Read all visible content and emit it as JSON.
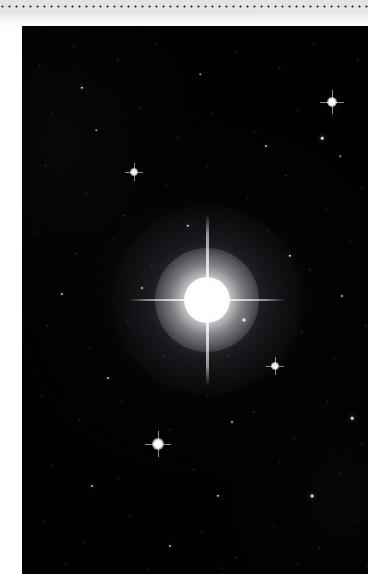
{
  "page": {
    "width": 368,
    "height": 574,
    "background_color": "#ffffff"
  },
  "top_band": {
    "name": "perforated-binding-edge",
    "height": 26,
    "gradient_from": "#e6e6e6",
    "gradient_to": "#fdfdfd",
    "perforation": {
      "dot_count": 53,
      "dot_spacing": 7,
      "dot_diameter": 2.7,
      "dot_color": "#3a3a3a",
      "row_y": 7
    }
  },
  "paper": {
    "margin_left_width": 22,
    "margin_color": "#ffffff"
  },
  "photo": {
    "name": "night-sky-photograph",
    "left": 22,
    "top": 26,
    "width": 346,
    "height": 548,
    "background_color": "#010102",
    "main_star": {
      "name": "bright-central-star",
      "x": 185,
      "y": 274,
      "core_diameter": 46,
      "halo_diameter": 190,
      "spike_vertical_length": 172,
      "spike_horizontal_length": 156,
      "color": "#ffffff"
    },
    "bright_stars": [
      {
        "x": 310,
        "y": 76,
        "size": 4.2,
        "opacity": 1.0,
        "flare": true
      },
      {
        "x": 136,
        "y": 418,
        "size": 4.6,
        "opacity": 1.0,
        "flare": true
      },
      {
        "x": 112,
        "y": 146,
        "size": 3.4,
        "opacity": 0.95,
        "flare": true
      },
      {
        "x": 253,
        "y": 340,
        "size": 3.2,
        "opacity": 0.95,
        "flare": true
      },
      {
        "x": 222,
        "y": 294,
        "size": 2.8,
        "opacity": 0.9,
        "flare": false
      },
      {
        "x": 300,
        "y": 112,
        "size": 2.6,
        "opacity": 0.85,
        "flare": false
      },
      {
        "x": 268,
        "y": 230,
        "size": 2.4,
        "opacity": 0.85,
        "flare": false
      },
      {
        "x": 60,
        "y": 62,
        "size": 2.4,
        "opacity": 0.8,
        "flare": false
      },
      {
        "x": 166,
        "y": 200,
        "size": 2.4,
        "opacity": 0.8,
        "flare": false
      },
      {
        "x": 40,
        "y": 268,
        "size": 2.2,
        "opacity": 0.8,
        "flare": false
      },
      {
        "x": 330,
        "y": 392,
        "size": 2.6,
        "opacity": 0.85,
        "flare": false
      },
      {
        "x": 196,
        "y": 470,
        "size": 2.4,
        "opacity": 0.8,
        "flare": false
      },
      {
        "x": 86,
        "y": 352,
        "size": 2.2,
        "opacity": 0.75,
        "flare": false
      },
      {
        "x": 290,
        "y": 470,
        "size": 2.8,
        "opacity": 0.85,
        "flare": false
      },
      {
        "x": 148,
        "y": 520,
        "size": 2.2,
        "opacity": 0.75,
        "flare": false
      },
      {
        "x": 244,
        "y": 120,
        "size": 2.2,
        "opacity": 0.75,
        "flare": false
      },
      {
        "x": 70,
        "y": 460,
        "size": 2.2,
        "opacity": 0.75,
        "flare": false
      },
      {
        "x": 320,
        "y": 270,
        "size": 2.0,
        "opacity": 0.7,
        "flare": false
      },
      {
        "x": 120,
        "y": 262,
        "size": 2.0,
        "opacity": 0.7,
        "flare": false
      },
      {
        "x": 210,
        "y": 396,
        "size": 2.0,
        "opacity": 0.7,
        "flare": false
      }
    ],
    "field_stars": [
      {
        "x": 18,
        "y": 40,
        "size": 1.3,
        "opacity": 0.52
      },
      {
        "x": 52,
        "y": 20,
        "size": 1.1,
        "opacity": 0.42
      },
      {
        "x": 96,
        "y": 34,
        "size": 1.4,
        "opacity": 0.55
      },
      {
        "x": 134,
        "y": 18,
        "size": 1.1,
        "opacity": 0.4
      },
      {
        "x": 178,
        "y": 48,
        "size": 1.5,
        "opacity": 0.6
      },
      {
        "x": 214,
        "y": 26,
        "size": 1.2,
        "opacity": 0.45
      },
      {
        "x": 258,
        "y": 42,
        "size": 1.3,
        "opacity": 0.5
      },
      {
        "x": 292,
        "y": 18,
        "size": 1.1,
        "opacity": 0.4
      },
      {
        "x": 336,
        "y": 34,
        "size": 1.4,
        "opacity": 0.55
      },
      {
        "x": 30,
        "y": 88,
        "size": 1.2,
        "opacity": 0.45
      },
      {
        "x": 74,
        "y": 104,
        "size": 1.5,
        "opacity": 0.6
      },
      {
        "x": 118,
        "y": 82,
        "size": 1.2,
        "opacity": 0.45
      },
      {
        "x": 156,
        "y": 112,
        "size": 1.4,
        "opacity": 0.55
      },
      {
        "x": 190,
        "y": 88,
        "size": 1.1,
        "opacity": 0.4
      },
      {
        "x": 232,
        "y": 106,
        "size": 1.3,
        "opacity": 0.5
      },
      {
        "x": 276,
        "y": 84,
        "size": 1.2,
        "opacity": 0.45
      },
      {
        "x": 318,
        "y": 130,
        "size": 1.5,
        "opacity": 0.6
      },
      {
        "x": 24,
        "y": 140,
        "size": 1.3,
        "opacity": 0.5
      },
      {
        "x": 64,
        "y": 168,
        "size": 1.2,
        "opacity": 0.45
      },
      {
        "x": 102,
        "y": 190,
        "size": 1.4,
        "opacity": 0.55
      },
      {
        "x": 144,
        "y": 160,
        "size": 1.1,
        "opacity": 0.4
      },
      {
        "x": 186,
        "y": 142,
        "size": 1.3,
        "opacity": 0.5
      },
      {
        "x": 226,
        "y": 172,
        "size": 1.2,
        "opacity": 0.45
      },
      {
        "x": 264,
        "y": 150,
        "size": 1.4,
        "opacity": 0.55
      },
      {
        "x": 304,
        "y": 184,
        "size": 1.2,
        "opacity": 0.45
      },
      {
        "x": 340,
        "y": 162,
        "size": 1.3,
        "opacity": 0.5
      },
      {
        "x": 16,
        "y": 206,
        "size": 1.2,
        "opacity": 0.45
      },
      {
        "x": 54,
        "y": 228,
        "size": 1.4,
        "opacity": 0.55
      },
      {
        "x": 92,
        "y": 212,
        "size": 1.1,
        "opacity": 0.4
      },
      {
        "x": 130,
        "y": 240,
        "size": 1.3,
        "opacity": 0.5
      },
      {
        "x": 246,
        "y": 204,
        "size": 1.2,
        "opacity": 0.45
      },
      {
        "x": 288,
        "y": 244,
        "size": 1.4,
        "opacity": 0.55
      },
      {
        "x": 328,
        "y": 216,
        "size": 1.2,
        "opacity": 0.45
      },
      {
        "x": 26,
        "y": 300,
        "size": 1.4,
        "opacity": 0.55
      },
      {
        "x": 68,
        "y": 322,
        "size": 1.2,
        "opacity": 0.45
      },
      {
        "x": 106,
        "y": 296,
        "size": 1.3,
        "opacity": 0.5
      },
      {
        "x": 142,
        "y": 330,
        "size": 1.1,
        "opacity": 0.4
      },
      {
        "x": 280,
        "y": 306,
        "size": 1.3,
        "opacity": 0.5
      },
      {
        "x": 312,
        "y": 332,
        "size": 1.2,
        "opacity": 0.45
      },
      {
        "x": 344,
        "y": 300,
        "size": 1.4,
        "opacity": 0.55
      },
      {
        "x": 20,
        "y": 370,
        "size": 1.2,
        "opacity": 0.45
      },
      {
        "x": 58,
        "y": 394,
        "size": 1.4,
        "opacity": 0.55
      },
      {
        "x": 100,
        "y": 376,
        "size": 1.1,
        "opacity": 0.4
      },
      {
        "x": 148,
        "y": 404,
        "size": 1.3,
        "opacity": 0.5
      },
      {
        "x": 186,
        "y": 370,
        "size": 1.2,
        "opacity": 0.45
      },
      {
        "x": 232,
        "y": 386,
        "size": 1.4,
        "opacity": 0.55
      },
      {
        "x": 272,
        "y": 412,
        "size": 1.2,
        "opacity": 0.45
      },
      {
        "x": 306,
        "y": 376,
        "size": 1.3,
        "opacity": 0.5
      },
      {
        "x": 340,
        "y": 418,
        "size": 1.2,
        "opacity": 0.45
      },
      {
        "x": 30,
        "y": 440,
        "size": 1.3,
        "opacity": 0.5
      },
      {
        "x": 96,
        "y": 452,
        "size": 1.2,
        "opacity": 0.45
      },
      {
        "x": 172,
        "y": 444,
        "size": 1.4,
        "opacity": 0.55
      },
      {
        "x": 222,
        "y": 462,
        "size": 1.1,
        "opacity": 0.4
      },
      {
        "x": 258,
        "y": 436,
        "size": 1.3,
        "opacity": 0.5
      },
      {
        "x": 318,
        "y": 448,
        "size": 1.2,
        "opacity": 0.45
      },
      {
        "x": 22,
        "y": 496,
        "size": 1.4,
        "opacity": 0.55
      },
      {
        "x": 62,
        "y": 516,
        "size": 1.2,
        "opacity": 0.45
      },
      {
        "x": 108,
        "y": 490,
        "size": 1.3,
        "opacity": 0.5
      },
      {
        "x": 180,
        "y": 506,
        "size": 1.2,
        "opacity": 0.45
      },
      {
        "x": 214,
        "y": 532,
        "size": 1.4,
        "opacity": 0.55
      },
      {
        "x": 252,
        "y": 500,
        "size": 1.1,
        "opacity": 0.4
      },
      {
        "x": 298,
        "y": 522,
        "size": 1.3,
        "opacity": 0.5
      },
      {
        "x": 334,
        "y": 494,
        "size": 1.2,
        "opacity": 0.45
      },
      {
        "x": 44,
        "y": 538,
        "size": 1.2,
        "opacity": 0.45
      },
      {
        "x": 126,
        "y": 544,
        "size": 1.3,
        "opacity": 0.5
      },
      {
        "x": 200,
        "y": 542,
        "size": 1.1,
        "opacity": 0.4
      },
      {
        "x": 276,
        "y": 538,
        "size": 1.2,
        "opacity": 0.45
      },
      {
        "x": 346,
        "y": 540,
        "size": 1.3,
        "opacity": 0.5
      },
      {
        "x": 160,
        "y": 250,
        "size": 1.1,
        "opacity": 0.4
      },
      {
        "x": 208,
        "y": 238,
        "size": 1.2,
        "opacity": 0.45
      },
      {
        "x": 172,
        "y": 318,
        "size": 1.1,
        "opacity": 0.4
      },
      {
        "x": 206,
        "y": 330,
        "size": 1.2,
        "opacity": 0.45
      }
    ]
  }
}
